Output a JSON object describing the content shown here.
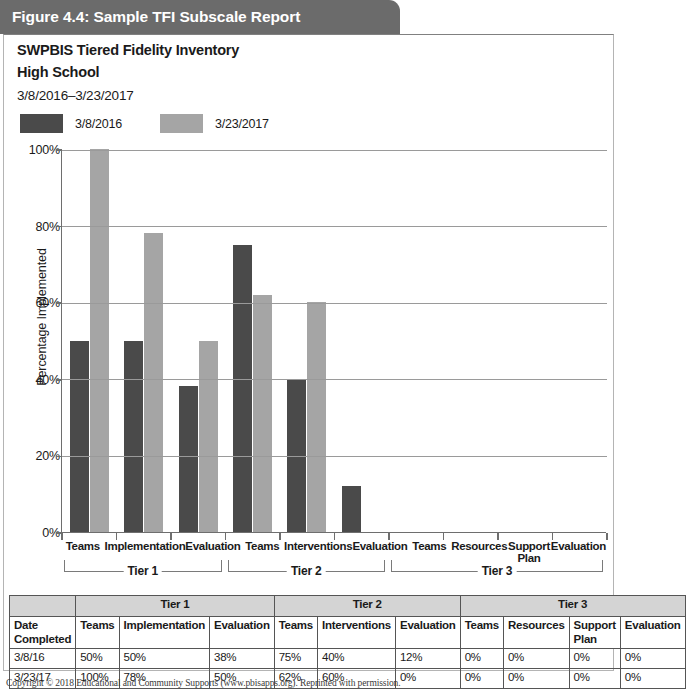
{
  "figure": {
    "title": "Figure 4.4: Sample TFI Subscale Report",
    "title_bg": "#6b6b6b"
  },
  "report": {
    "title": "SWPBIS Tiered Fidelity Inventory",
    "subtitle": "High School",
    "date_range": "3/8/2016–3/23/2017"
  },
  "legend": {
    "series": [
      {
        "label": "3/8/2016",
        "color": "#4a4a4a"
      },
      {
        "label": "3/23/2017",
        "color": "#a5a5a5"
      }
    ]
  },
  "chart_data": {
    "type": "bar",
    "title": "",
    "xlabel": "",
    "ylabel": "Percentage Implemented",
    "ylim": [
      0,
      100
    ],
    "yticks": [
      "0%",
      "20%",
      "40%",
      "60%",
      "80%",
      "100%"
    ],
    "ytick_values": [
      0,
      20,
      40,
      60,
      80,
      100
    ],
    "grid": "horizontal",
    "legend_position": "top-left",
    "categories": [
      "Teams",
      "Implementation",
      "Evaluation",
      "Teams",
      "Interventions",
      "Evaluation",
      "Teams",
      "Resources",
      "Support Plan",
      "Evaluation"
    ],
    "groups": [
      {
        "label": "Tier 1",
        "span": 3
      },
      {
        "label": "Tier 2",
        "span": 3
      },
      {
        "label": "Tier 3",
        "span": 4
      }
    ],
    "series": [
      {
        "name": "3/8/2016",
        "color": "#4a4a4a",
        "values": [
          50,
          50,
          38,
          75,
          40,
          12,
          0,
          0,
          0,
          0
        ]
      },
      {
        "name": "3/23/2017",
        "color": "#a5a5a5",
        "values": [
          100,
          78,
          50,
          62,
          60,
          0,
          0,
          0,
          0,
          0
        ]
      }
    ]
  },
  "table": {
    "group_header_blank": "",
    "groups": [
      "Tier 1",
      "Tier 2",
      "Tier 3"
    ],
    "columns": [
      "Date Completed",
      "Teams",
      "Implementation",
      "Evaluation",
      "Teams",
      "Interventions",
      "Evaluation",
      "Teams",
      "Resources",
      "Support Plan",
      "Evaluation"
    ],
    "rows": [
      {
        "date": "3/8/16",
        "values": [
          "50%",
          "50%",
          "38%",
          "75%",
          "40%",
          "12%",
          "0%",
          "0%",
          "0%",
          "0%"
        ]
      },
      {
        "date": "3/23/17",
        "values": [
          "100%",
          "78%",
          "50%",
          "62%",
          "60%",
          "0%",
          "0%",
          "0%",
          "0%",
          "0%"
        ]
      }
    ]
  },
  "footer": {
    "copyright": "Copyright © 2018 Educational and Community Supports (www.pbisapps.org). Reprinted with permission."
  }
}
